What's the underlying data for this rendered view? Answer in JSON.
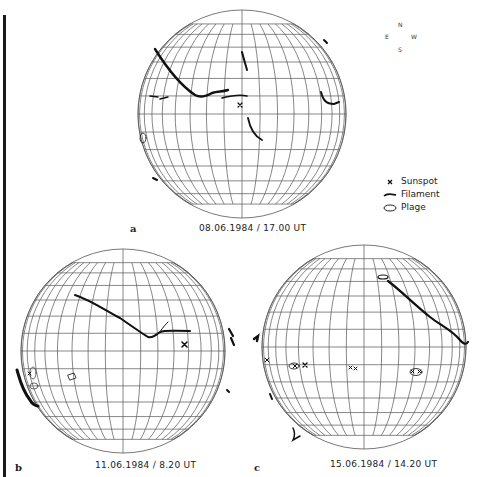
{
  "compass": {
    "north": "N",
    "east": "E",
    "west": "W",
    "south": "S"
  },
  "legend": {
    "items": [
      {
        "symbol": "sunspot-cross",
        "label": "Sunspot"
      },
      {
        "symbol": "filament-line",
        "label": "Filament"
      },
      {
        "symbol": "plage-ellipse",
        "label": "Plage"
      }
    ]
  },
  "panels": [
    {
      "id": "a",
      "letter": "a",
      "caption": "08.06.1984 / 17.00 UT",
      "center": [
        242,
        114
      ],
      "radius": 104
    },
    {
      "id": "b",
      "letter": "b",
      "caption": "11.06.1984 / 8.20 UT",
      "center": [
        123,
        351
      ],
      "radius": 102
    },
    {
      "id": "c",
      "letter": "c",
      "caption": "15.06.1984 / 14.20 UT",
      "center": [
        364,
        347
      ],
      "radius": 102
    }
  ],
  "colors": {
    "grid": "#555555",
    "ink": "#111111",
    "background": "#ffffff"
  }
}
